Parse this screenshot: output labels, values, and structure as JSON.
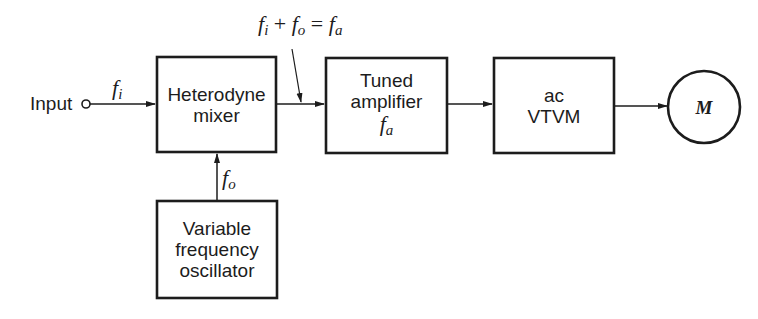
{
  "diagram": {
    "type": "block-diagram",
    "colors": {
      "line": "#1c1c1c",
      "background": "#ffffff"
    },
    "input": {
      "label": "Input",
      "signal": {
        "symbol": "f",
        "subscript": "i"
      }
    },
    "blocks": [
      {
        "id": "mixer",
        "lines": [
          "Heterodyne",
          "mixer"
        ]
      },
      {
        "id": "tuned_amplifier",
        "lines": [
          "Tuned",
          "amplifier"
        ],
        "signal": {
          "symbol": "f",
          "subscript": "a"
        }
      },
      {
        "id": "vtvm",
        "lines": [
          "ac",
          "VTVM"
        ]
      },
      {
        "id": "oscillator",
        "lines": [
          "Variable",
          "frequency",
          "oscillator"
        ]
      }
    ],
    "meter": {
      "label": "M"
    },
    "signals": {
      "oscillator_out": {
        "symbol": "f",
        "subscript": "o"
      },
      "mixer_out_equation": {
        "term1": {
          "symbol": "f",
          "subscript": "i"
        },
        "op1": "+",
        "term2": {
          "symbol": "f",
          "subscript": "o"
        },
        "op2": "=",
        "result": {
          "symbol": "f",
          "subscript": "a"
        }
      }
    },
    "connections": [
      {
        "from": "input",
        "to": "mixer",
        "label": "f_i"
      },
      {
        "from": "oscillator",
        "to": "mixer",
        "label": "f_o"
      },
      {
        "from": "mixer",
        "to": "tuned_amplifier",
        "label": "f_i + f_o = f_a"
      },
      {
        "from": "tuned_amplifier",
        "to": "vtvm"
      },
      {
        "from": "vtvm",
        "to": "meter"
      }
    ]
  }
}
